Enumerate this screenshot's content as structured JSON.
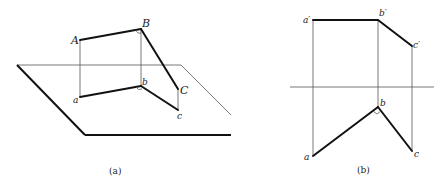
{
  "figure_a": {
    "caption": "(a)",
    "labels": {
      "A": "A",
      "B": "B",
      "C": "C",
      "a": "a",
      "b": "b",
      "c": "c"
    }
  },
  "figure_b": {
    "caption": "(b)",
    "labels": {
      "a_prime": "a′",
      "b_prime": "b′",
      "c_prime": "c′",
      "a": "a",
      "b": "b",
      "c": "c"
    }
  },
  "colors": {
    "thick_line": "#111111",
    "thin_line": "#555555",
    "background": "#ffffff"
  }
}
